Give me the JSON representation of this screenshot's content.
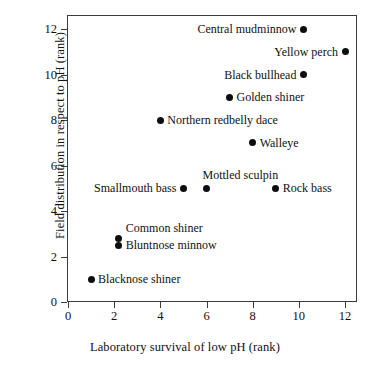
{
  "chart_data": {
    "type": "scatter",
    "title": "",
    "xlabel": "Laboratory survival of low pH (rank)",
    "ylabel": "Field distribution in respect to pH (rank)",
    "xlim": [
      0,
      13
    ],
    "ylim": [
      0,
      13
    ],
    "xticks": [
      0,
      2,
      4,
      6,
      8,
      10,
      12
    ],
    "yticks": [
      0,
      2,
      4,
      6,
      8,
      10,
      12
    ],
    "grid": false,
    "legend": "none",
    "marker": "filled-circle",
    "marker_color": "#0d0d0d",
    "points": [
      {
        "label": "Central mudminnow",
        "x": 10.2,
        "y": 12.0,
        "label_side": "left"
      },
      {
        "label": "Yellow perch",
        "x": 12.0,
        "y": 11.0,
        "label_side": "left"
      },
      {
        "label": "Black bullhead",
        "x": 10.2,
        "y": 10.0,
        "label_side": "left"
      },
      {
        "label": "Golden shiner",
        "x": 7.0,
        "y": 9.0,
        "label_side": "right"
      },
      {
        "label": "Northern redbelly dace",
        "x": 4.0,
        "y": 8.0,
        "label_side": "right"
      },
      {
        "label": "Walleye",
        "x": 8.0,
        "y": 7.0,
        "label_side": "right"
      },
      {
        "label": "Mottled sculpin",
        "x": 6.0,
        "y": 5.0,
        "label_side": "above"
      },
      {
        "label": "Smallmouth bass",
        "x": 5.0,
        "y": 5.0,
        "label_side": "left"
      },
      {
        "label": "Rock bass",
        "x": 9.0,
        "y": 5.0,
        "label_side": "right"
      },
      {
        "label": "Common shiner",
        "x": 2.2,
        "y": 2.8,
        "label_side": "above-right"
      },
      {
        "label": "Bluntnose minnow",
        "x": 2.2,
        "y": 2.5,
        "label_side": "right"
      },
      {
        "label": "Blacknose shiner",
        "x": 1.0,
        "y": 1.0,
        "label_side": "right"
      }
    ]
  },
  "axes": {
    "x_title": "Laboratory survival of low pH (rank)",
    "y_title": "Field distribution in respect to pH (rank)",
    "x_tick_labels": [
      "0",
      "2",
      "4",
      "6",
      "8",
      "10",
      "12"
    ],
    "y_tick_labels": [
      "0",
      "2",
      "4",
      "6",
      "8",
      "10",
      "12"
    ]
  }
}
